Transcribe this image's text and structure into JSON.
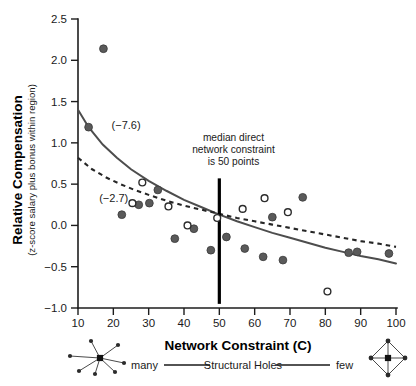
{
  "chart_data": {
    "type": "scatter",
    "title": "",
    "xlabel": "Network Constraint (C)",
    "ylabel": "Relative Compensation",
    "ylabel_sub": "(z-score salary plus bonus within region)",
    "xlim": [
      5,
      103
    ],
    "ylim": [
      -1.0,
      2.5
    ],
    "xticks": [
      10,
      20,
      30,
      40,
      50,
      60,
      70,
      80,
      90,
      100
    ],
    "xtick_labels": [
      "10",
      "20",
      "30",
      "40",
      "50",
      "60",
      "70",
      "80",
      "90",
      "100"
    ],
    "yticks": [
      -1.0,
      -0.5,
      0.0,
      0.5,
      1.0,
      1.5,
      2.0,
      2.5
    ],
    "ytick_labels": [
      "-1.0",
      "-0.5",
      "0.0",
      "0.5",
      "1.0",
      "1.5",
      "2.0",
      "2.5"
    ],
    "grid": false,
    "legend_position": "below-axis",
    "series": [
      {
        "name": "filled-circles",
        "marker": "filled circle",
        "color": "#5a5a5a",
        "points": [
          {
            "x": 17.2,
            "y": 2.14
          },
          {
            "x": 13.0,
            "y": 1.19
          },
          {
            "x": 22.4,
            "y": 0.13
          },
          {
            "x": 27.2,
            "y": 0.25
          },
          {
            "x": 32.6,
            "y": 0.43
          },
          {
            "x": 30.2,
            "y": 0.27
          },
          {
            "x": 37.4,
            "y": -0.16
          },
          {
            "x": 42.8,
            "y": -0.04
          },
          {
            "x": 47.6,
            "y": -0.3
          },
          {
            "x": 52.0,
            "y": -0.14
          },
          {
            "x": 57.2,
            "y": -0.28
          },
          {
            "x": 62.4,
            "y": -0.38
          },
          {
            "x": 65.0,
            "y": 0.1
          },
          {
            "x": 68.0,
            "y": -0.42
          },
          {
            "x": 73.6,
            "y": 0.34
          },
          {
            "x": 86.6,
            "y": -0.33
          },
          {
            "x": 89.0,
            "y": -0.32
          },
          {
            "x": 98.0,
            "y": -0.34
          }
        ]
      },
      {
        "name": "open-circles",
        "marker": "open circle",
        "color": "#ffffff",
        "points": [
          {
            "x": 25.4,
            "y": 0.27
          },
          {
            "x": 28.2,
            "y": 0.52
          },
          {
            "x": 35.6,
            "y": 0.23
          },
          {
            "x": 41.0,
            "y": 0.0
          },
          {
            "x": 49.4,
            "y": 0.09
          },
          {
            "x": 56.6,
            "y": 0.2
          },
          {
            "x": 62.8,
            "y": 0.33
          },
          {
            "x": 69.4,
            "y": 0.16
          },
          {
            "x": 80.6,
            "y": -0.8
          }
        ]
      }
    ],
    "fit_curves": [
      {
        "name": "solid-fit",
        "style": "solid",
        "label": "(-7.6)",
        "label_x": 19.5,
        "label_y": 1.22,
        "color": "#4d4d4d",
        "points": [
          {
            "x": 10.0,
            "y": 1.4
          },
          {
            "x": 13.0,
            "y": 1.19
          },
          {
            "x": 17.0,
            "y": 0.98
          },
          {
            "x": 21.0,
            "y": 0.82
          },
          {
            "x": 25.0,
            "y": 0.68
          },
          {
            "x": 30.0,
            "y": 0.54
          },
          {
            "x": 35.0,
            "y": 0.42
          },
          {
            "x": 40.0,
            "y": 0.31
          },
          {
            "x": 45.0,
            "y": 0.22
          },
          {
            "x": 50.0,
            "y": 0.13
          },
          {
            "x": 55.0,
            "y": 0.05
          },
          {
            "x": 60.0,
            "y": -0.02
          },
          {
            "x": 65.0,
            "y": -0.09
          },
          {
            "x": 70.0,
            "y": -0.15
          },
          {
            "x": 75.0,
            "y": -0.21
          },
          {
            "x": 80.0,
            "y": -0.27
          },
          {
            "x": 85.0,
            "y": -0.32
          },
          {
            "x": 90.0,
            "y": -0.37
          },
          {
            "x": 95.0,
            "y": -0.41
          },
          {
            "x": 100.0,
            "y": -0.46
          }
        ]
      },
      {
        "name": "dashed-fit",
        "style": "dashed",
        "label": "(-2.7)",
        "label_x": 16.0,
        "label_y": 0.33,
        "color": "#262626",
        "points": [
          {
            "x": 10.0,
            "y": 0.82
          },
          {
            "x": 14.0,
            "y": 0.68
          },
          {
            "x": 18.0,
            "y": 0.58
          },
          {
            "x": 22.0,
            "y": 0.5
          },
          {
            "x": 26.0,
            "y": 0.43
          },
          {
            "x": 30.0,
            "y": 0.37
          },
          {
            "x": 35.0,
            "y": 0.3
          },
          {
            "x": 40.0,
            "y": 0.24
          },
          {
            "x": 45.0,
            "y": 0.19
          },
          {
            "x": 50.0,
            "y": 0.14
          },
          {
            "x": 55.0,
            "y": 0.09
          },
          {
            "x": 60.0,
            "y": 0.05
          },
          {
            "x": 65.0,
            "y": 0.01
          },
          {
            "x": 70.0,
            "y": -0.03
          },
          {
            "x": 75.0,
            "y": -0.07
          },
          {
            "x": 80.0,
            "y": -0.11
          },
          {
            "x": 85.0,
            "y": -0.15
          },
          {
            "x": 90.0,
            "y": -0.19
          },
          {
            "x": 95.0,
            "y": -0.22
          },
          {
            "x": 100.0,
            "y": -0.26
          }
        ]
      }
    ],
    "annotations": [
      {
        "name": "median-constraint-note",
        "lines": [
          "median direct",
          "network constraint",
          "is 50 points"
        ],
        "x": 54,
        "y": 1.02
      }
    ],
    "reference_lines": [
      {
        "name": "median-constraint-line",
        "orientation": "vertical",
        "x": 50,
        "y_start": -0.95,
        "y_end": 0.57
      }
    ]
  },
  "legend": {
    "left_label": "many",
    "center_label": "Structural Holes",
    "right_label": "few",
    "left_icon": "hub-network-icon",
    "right_icon": "diamond-network-icon"
  }
}
